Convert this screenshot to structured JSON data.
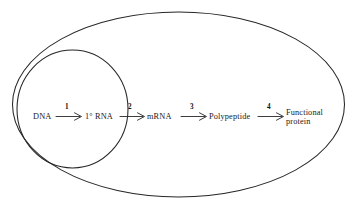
{
  "diagram": {
    "type": "biology-flow-diagram",
    "background_color": "#ffffff",
    "stroke_color": "#262626",
    "text_color": "#1a1a1a",
    "compartments": [
      {
        "name": "cell",
        "shape": "ellipse",
        "label": ""
      },
      {
        "name": "nucleus",
        "shape": "ellipse",
        "label": ""
      }
    ],
    "nodes": [
      {
        "id": "dna",
        "label": "DNA",
        "label_line2": "",
        "compartment": "nucleus"
      },
      {
        "id": "primaryrna",
        "label": "1° RNA",
        "label_line2": "",
        "compartment": "nucleus"
      },
      {
        "id": "mrna",
        "label": "mRNA",
        "label_line2": "",
        "compartment": "cytoplasm"
      },
      {
        "id": "polypeptide",
        "label": "Polypeptide",
        "label_line2": "",
        "compartment": "cytoplasm"
      },
      {
        "id": "protein",
        "label": "Functional",
        "label_line2": "protein",
        "compartment": "cytoplasm"
      }
    ],
    "arrows": [
      {
        "id": "step-1",
        "number": "1",
        "from": "dna",
        "to": "primaryrna"
      },
      {
        "id": "step-2",
        "number": "2",
        "from": "primaryrna",
        "to": "mrna"
      },
      {
        "id": "step-3",
        "number": "3",
        "from": "mrna",
        "to": "polypeptide"
      },
      {
        "id": "step-4",
        "number": "4",
        "from": "polypeptide",
        "to": "protein"
      }
    ]
  }
}
